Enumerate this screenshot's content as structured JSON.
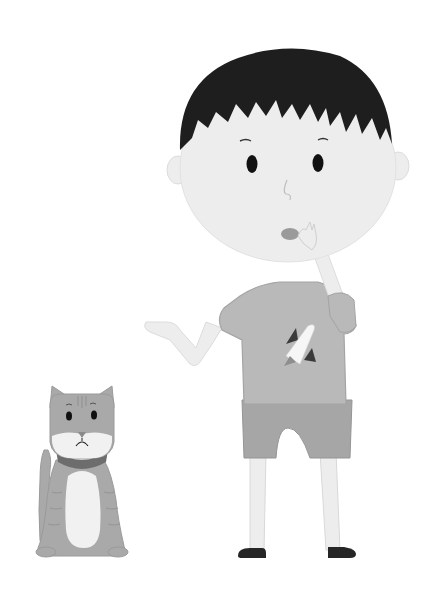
{
  "image": {
    "description": "Grayscale cartoon illustration of a thoughtful boy pointing left and a sad tabby cat sitting beside him",
    "colors": {
      "background": "#ffffff",
      "skin": "#ededed",
      "skin_outline": "#d6d6d6",
      "hair": "#1e1e1e",
      "shirt": "#b9b9b9",
      "shirt_outline": "#a4a4a4",
      "shorts": "#a6a6a6",
      "shoes": "#262626",
      "rocket_body": "#f6f6f6",
      "rocket_fins": "#3a3a3a",
      "rocket_flame": "#8e8e8e",
      "mouth": "#9a9a9a",
      "cat_fur": "#a9a9a9",
      "cat_stripes": "#959595",
      "cat_belly": "#f1f1f1",
      "cat_collar": "#6d6d6d",
      "eyes": "#111111"
    }
  },
  "figures": {
    "boy": {
      "label": "boy",
      "pose": "pointing left, hand on chin",
      "shirt_graphic": "rocket"
    },
    "cat": {
      "label": "cat",
      "expression": "sad",
      "accessory": "collar"
    }
  }
}
